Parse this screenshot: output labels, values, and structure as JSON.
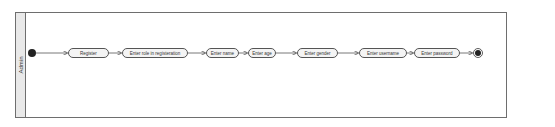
{
  "diagram": {
    "type": "activity",
    "swimlane": {
      "label": "Admin"
    },
    "start": {
      "kind": "initial-node"
    },
    "activities": [
      {
        "label": "Register"
      },
      {
        "label": "Enter role in registeration"
      },
      {
        "label": "Enter name"
      },
      {
        "label": "Enter age"
      },
      {
        "label": "Enter gender"
      },
      {
        "label": "Enter username"
      },
      {
        "label": "Enter password"
      }
    ],
    "end": {
      "kind": "final-node"
    },
    "colors": {
      "border": "#6e6e6e",
      "lane_strip": "#e9e9e9",
      "node_fill": "#f4f4f4",
      "initial_node": "#222222"
    }
  }
}
